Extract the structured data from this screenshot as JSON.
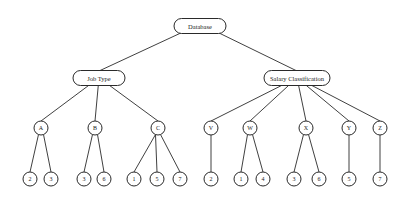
{
  "diagram": {
    "type": "tree",
    "root": {
      "id": "database",
      "label": "Database",
      "x": 200,
      "y": 26,
      "w": 52,
      "h": 15
    },
    "level1": [
      {
        "id": "job-type",
        "label": "Job Type",
        "x": 99,
        "y": 78,
        "w": 52,
        "h": 15
      },
      {
        "id": "salary-classification",
        "label": "Salary Classification",
        "x": 297,
        "y": 78,
        "w": 66,
        "h": 15
      }
    ],
    "level2": [
      {
        "id": "A",
        "label": "A",
        "parent": "job-type",
        "x": 41,
        "y": 128
      },
      {
        "id": "B",
        "label": "B",
        "parent": "job-type",
        "x": 95,
        "y": 128
      },
      {
        "id": "C",
        "label": "C",
        "parent": "job-type",
        "x": 158,
        "y": 128
      },
      {
        "id": "V",
        "label": "V",
        "parent": "salary-classification",
        "x": 211,
        "y": 128
      },
      {
        "id": "W",
        "label": "W",
        "parent": "salary-classification",
        "x": 250,
        "y": 128
      },
      {
        "id": "X",
        "label": "X",
        "parent": "salary-classification",
        "x": 306,
        "y": 128
      },
      {
        "id": "Y",
        "label": "Y",
        "parent": "salary-classification",
        "x": 349,
        "y": 128
      },
      {
        "id": "Z",
        "label": "Z",
        "parent": "salary-classification",
        "x": 380,
        "y": 128
      }
    ],
    "leaves": [
      {
        "label": "2",
        "parent": "A",
        "x": 30,
        "y": 179
      },
      {
        "label": "3",
        "parent": "A",
        "x": 51,
        "y": 179
      },
      {
        "label": "3",
        "parent": "B",
        "x": 84,
        "y": 179
      },
      {
        "label": "6",
        "parent": "B",
        "x": 104,
        "y": 179
      },
      {
        "label": "1",
        "parent": "C",
        "x": 134,
        "y": 179
      },
      {
        "label": "5",
        "parent": "C",
        "x": 157,
        "y": 179
      },
      {
        "label": "7",
        "parent": "C",
        "x": 180,
        "y": 179
      },
      {
        "label": "2",
        "parent": "V",
        "x": 211,
        "y": 179
      },
      {
        "label": "1",
        "parent": "W",
        "x": 241,
        "y": 179
      },
      {
        "label": "4",
        "parent": "W",
        "x": 263,
        "y": 179
      },
      {
        "label": "3",
        "parent": "X",
        "x": 294,
        "y": 179
      },
      {
        "label": "6",
        "parent": "X",
        "x": 319,
        "y": 179
      },
      {
        "label": "5",
        "parent": "Y",
        "x": 349,
        "y": 179
      },
      {
        "label": "7",
        "parent": "Z",
        "x": 380,
        "y": 179
      }
    ],
    "circle_radius": 7,
    "colors": {
      "stroke": "#2a2a2a",
      "fill": "#ffffff",
      "text": "#1a1a1a",
      "background": "#ffffff"
    }
  }
}
